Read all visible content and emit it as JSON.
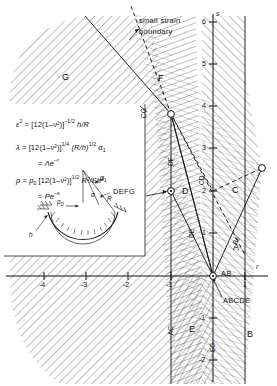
{
  "figure": {
    "kind": "stability-regime-map",
    "axes": {
      "x_label": "r",
      "y_label": "s",
      "x_ticks": [
        "-4",
        "-3",
        "-2",
        "-1",
        "1"
      ],
      "y_ticks": [
        "6",
        "5",
        "4",
        "3",
        "2",
        "1",
        "-1",
        "-2"
      ],
      "x_range": [
        -4.8,
        1.45
      ],
      "y_range": [
        -2.45,
        6.6
      ]
    },
    "annotations": {
      "small_strain_line1": "small strain",
      "small_strain_line2": "boundary",
      "defg_callout": "DEFG",
      "abcde_callout": "ABCDE",
      "ab_callout": "AB"
    },
    "regions": [
      {
        "id": "A",
        "label": "A"
      },
      {
        "id": "B",
        "label": "B"
      },
      {
        "id": "C",
        "label": "C"
      },
      {
        "id": "D",
        "label": "D"
      },
      {
        "id": "E",
        "label": "E"
      },
      {
        "id": "F",
        "label": "F"
      },
      {
        "id": "G",
        "label": "G"
      }
    ],
    "curve_labels": [
      "CG",
      "DF",
      "CD",
      "DE",
      "AC",
      "EG",
      "BE"
    ],
    "markers": [
      {
        "name": "vertex-upper",
        "r": -1.0,
        "s": 3.95
      },
      {
        "name": "vertex-defg",
        "r": -1.0,
        "s": 2.05
      },
      {
        "name": "vertex-origin",
        "r": 0.0,
        "s": 0.0
      },
      {
        "name": "vertex-right",
        "r": 1.0,
        "s": 2.0
      }
    ]
  },
  "equations": {
    "eq1": {
      "lhs": "ε",
      "lhs_sup": "2",
      "eq": "=",
      "bracket": "[12(1–ν²)]",
      "exp": "–1/2",
      "tail": "h/R"
    },
    "eq2": {
      "lhs": "λ",
      "eq": "=",
      "bracket": "[12(1–ν²)]",
      "exp": "1/4",
      "mid": "(R/h)",
      "mid_exp": "1/2",
      "tail": "α",
      "tail_sub": "1"
    },
    "eq2b": {
      "eq": "=",
      "body": "Λe",
      "exp": "–r"
    },
    "eq3": {
      "lhs": "p",
      "eq": "=",
      "p0": "p",
      "p0_sub": "0",
      "bracket": "[12(1–ν²)]",
      "exp": "1/2",
      "tail": "R²/Eh²"
    },
    "eq3b": {
      "eq": "=",
      "body": "Pe",
      "exp": "–s"
    }
  },
  "inset": {
    "name": "shallow-spherical-cap-sketch",
    "labels": {
      "alpha1": "α",
      "alpha1_sub": "1",
      "alpha": "α",
      "R": "R",
      "p0": "p",
      "p0_sub": "0",
      "h": "h"
    }
  },
  "colors": {
    "ink": "#111111",
    "hatch": "#555555",
    "paper": "#ffffff"
  }
}
